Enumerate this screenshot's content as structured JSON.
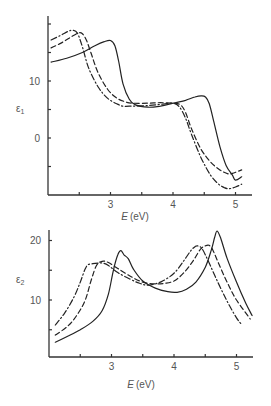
{
  "chart_data": [
    {
      "type": "line",
      "title": "",
      "xlabel_main": "E",
      "xlabel_unit": "(eV)",
      "ylabel_main": "ε",
      "ylabel_sub": "1",
      "xlim": [
        2.0,
        5.3
      ],
      "ylim": [
        -10,
        21
      ],
      "xticks": [
        2.5,
        3,
        3.5,
        4,
        4.5,
        5
      ],
      "xtick_labels": [
        "",
        "3",
        "",
        "4",
        "",
        "5"
      ],
      "yticks": [
        20,
        15,
        10,
        5,
        0,
        -5
      ],
      "ytick_labels": [
        "",
        "",
        "10",
        "",
        "0",
        ""
      ],
      "grid": false,
      "legend": "none",
      "series": [
        {
          "name": "solid",
          "style": "solid",
          "x": [
            2.05,
            2.3,
            2.55,
            2.75,
            2.9,
            3.0,
            3.07,
            3.13,
            3.2,
            3.3,
            3.4,
            3.6,
            3.8,
            4.0,
            4.2,
            4.35,
            4.45,
            4.52,
            4.58,
            4.65,
            4.75,
            4.85,
            4.95,
            5.0,
            5.1
          ],
          "y": [
            13.3,
            14.0,
            15.0,
            16.2,
            16.9,
            17.1,
            16.2,
            13.5,
            9.5,
            6.8,
            5.8,
            5.4,
            5.6,
            6.1,
            6.6,
            7.2,
            7.4,
            7.2,
            6.0,
            3.0,
            -1.5,
            -4.8,
            -6.5,
            -7.4,
            -6.8
          ]
        },
        {
          "name": "dashed",
          "style": "dashed",
          "x": [
            2.05,
            2.2,
            2.35,
            2.48,
            2.55,
            2.62,
            2.7,
            2.8,
            2.95,
            3.1,
            3.25,
            3.35,
            3.6,
            3.8,
            4.0,
            4.12,
            4.2,
            4.3,
            4.45,
            4.6,
            4.75,
            4.88,
            4.95,
            5.1
          ],
          "y": [
            15.8,
            16.6,
            17.6,
            18.4,
            18.3,
            17.0,
            14.5,
            11.5,
            8.6,
            7.0,
            6.3,
            6.1,
            6.1,
            6.2,
            6.1,
            5.8,
            4.5,
            1.5,
            -2.0,
            -4.2,
            -5.6,
            -6.3,
            -6.2,
            -5.6
          ]
        },
        {
          "name": "dash-dot",
          "style": "dash-dot",
          "x": [
            2.05,
            2.2,
            2.32,
            2.4,
            2.47,
            2.55,
            2.65,
            2.8,
            2.95,
            3.1,
            3.2,
            3.35,
            3.6,
            3.8,
            4.0,
            4.1,
            4.2,
            4.3,
            4.45,
            4.6,
            4.72,
            4.82,
            4.9,
            5.0,
            5.1
          ],
          "y": [
            17.2,
            18.0,
            18.7,
            18.9,
            18.4,
            16.0,
            12.3,
            9.0,
            7.0,
            6.0,
            5.6,
            5.6,
            5.7,
            5.9,
            6.1,
            5.5,
            3.5,
            0.5,
            -3.5,
            -6.5,
            -8.0,
            -8.7,
            -8.9,
            -8.6,
            -8.1
          ]
        }
      ]
    },
    {
      "type": "line",
      "title": "",
      "xlabel_main": "E",
      "xlabel_unit": "(eV)",
      "ylabel_main": "ε",
      "ylabel_sub": "2",
      "xlim": [
        2.0,
        5.3
      ],
      "ylim": [
        0,
        21.8
      ],
      "xticks": [
        2.5,
        3,
        3.5,
        4,
        4.5,
        5
      ],
      "xtick_labels": [
        "",
        "3",
        "",
        "4",
        "",
        "5"
      ],
      "yticks": [
        20,
        15,
        10,
        5
      ],
      "ytick_labels": [
        "20",
        "",
        "10",
        ""
      ],
      "grid": false,
      "legend": "none",
      "series": [
        {
          "name": "solid",
          "style": "solid",
          "x": [
            2.1,
            2.3,
            2.5,
            2.7,
            2.85,
            2.95,
            3.03,
            3.1,
            3.15,
            3.2,
            3.27,
            3.35,
            3.5,
            3.7,
            3.9,
            4.05,
            4.2,
            4.35,
            4.5,
            4.6,
            4.65,
            4.69,
            4.75,
            4.85,
            5.0,
            5.15,
            5.25
          ],
          "y": [
            2.9,
            3.9,
            5.0,
            6.4,
            8.2,
            11.0,
            15.0,
            17.6,
            18.3,
            17.6,
            16.9,
            15.2,
            13.2,
            12.0,
            11.4,
            11.3,
            11.8,
            13.0,
            15.5,
            18.5,
            20.5,
            21.6,
            20.3,
            17.0,
            13.0,
            9.4,
            7.4
          ]
        },
        {
          "name": "dashed",
          "style": "dashed",
          "x": [
            2.1,
            2.3,
            2.45,
            2.58,
            2.68,
            2.76,
            2.85,
            2.95,
            3.1,
            3.3,
            3.5,
            3.7,
            3.85,
            4.0,
            4.15,
            4.3,
            4.42,
            4.5,
            4.56,
            4.62,
            4.72,
            4.85,
            5.0,
            5.22
          ],
          "y": [
            4.1,
            5.6,
            7.5,
            10.0,
            13.5,
            15.8,
            16.5,
            16.3,
            15.3,
            14.0,
            13.0,
            12.7,
            12.8,
            13.2,
            14.5,
            16.5,
            18.5,
            19.1,
            19.2,
            18.4,
            16.0,
            13.0,
            10.0,
            6.8
          ]
        },
        {
          "name": "dash-dot",
          "style": "dash-dot",
          "x": [
            2.1,
            2.25,
            2.4,
            2.5,
            2.57,
            2.62,
            2.7,
            2.8,
            2.86,
            2.95,
            3.1,
            3.3,
            3.45,
            3.6,
            3.8,
            4.0,
            4.15,
            4.27,
            4.34,
            4.38,
            4.45,
            4.55,
            4.7,
            4.85,
            5.0,
            5.09
          ],
          "y": [
            5.8,
            7.8,
            10.5,
            13.0,
            15.0,
            15.9,
            16.1,
            16.2,
            16.2,
            15.8,
            14.6,
            13.5,
            12.8,
            12.5,
            13.1,
            14.5,
            16.5,
            18.3,
            19.0,
            19.1,
            18.6,
            16.5,
            13.0,
            9.8,
            7.0,
            5.8
          ]
        }
      ]
    }
  ]
}
